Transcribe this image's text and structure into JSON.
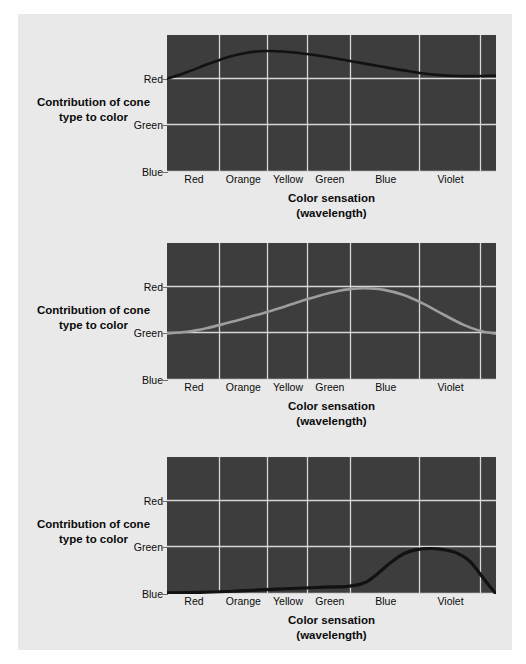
{
  "figure": {
    "background_color": "#e9e9e9",
    "page_color": "#ffffff"
  },
  "axis": {
    "y_title_line1": "Contribution of",
    "y_title_line2": "cone type to color",
    "x_title_line1": "Color sensation",
    "x_title_line2": "(wavelength)",
    "y_ticks": [
      "Red",
      "Green",
      "Blue"
    ],
    "x_ticks": [
      "Red",
      "Orange",
      "Yellow",
      "Green",
      "Blue",
      "Violet"
    ]
  },
  "chart_data": [
    {
      "type": "line",
      "title": "Red cone (long-wavelength) response",
      "xlabel": "Color sensation (wavelength)",
      "ylabel": "Contribution of cone type to color",
      "grid": true,
      "legend": "none",
      "plot_background": "#3d3d3d",
      "grid_color": "#d8d8d8",
      "line_color": "#121212",
      "line_width": 2.6,
      "y_tick_labels": [
        "Red",
        "Green",
        "Blue"
      ],
      "y_tick_positions": [
        0.32,
        0.66,
        1.0
      ],
      "x_tick_labels": [
        "Red",
        "Orange",
        "Yellow",
        "Green",
        "Blue",
        "Violet"
      ],
      "x_gridline_positions": [
        0.161,
        0.307,
        0.429,
        0.56,
        0.77,
        0.955
      ],
      "x_tick_label_positions": [
        0.082,
        0.232,
        0.368,
        0.495,
        0.665,
        0.862
      ],
      "x": [
        0.0,
        0.06,
        0.12,
        0.16,
        0.2,
        0.25,
        0.3,
        0.35,
        0.43,
        0.5,
        0.58,
        0.66,
        0.74,
        0.8,
        0.86,
        0.92,
        1.0
      ],
      "y": [
        0.32,
        0.272,
        0.216,
        0.182,
        0.152,
        0.127,
        0.117,
        0.12,
        0.14,
        0.166,
        0.2,
        0.234,
        0.266,
        0.286,
        0.297,
        0.3,
        0.297
      ],
      "note": "y in normalized plot fraction, 0 = top of plot, 1 = bottom of plot"
    },
    {
      "type": "line",
      "title": "Green cone (medium-wavelength) response",
      "xlabel": "Color sensation (wavelength)",
      "ylabel": "Contribution of cone type to color",
      "grid": true,
      "legend": "none",
      "plot_background": "#3d3d3d",
      "grid_color": "#d8d8d8",
      "line_color": "#9d9d9d",
      "line_width": 2.6,
      "y_tick_labels": [
        "Red",
        "Green",
        "Blue"
      ],
      "y_tick_positions": [
        0.32,
        0.66,
        1.0
      ],
      "x_tick_labels": [
        "Red",
        "Orange",
        "Yellow",
        "Green",
        "Blue",
        "Violet"
      ],
      "x_gridline_positions": [
        0.161,
        0.307,
        0.429,
        0.56,
        0.77,
        0.955
      ],
      "x_tick_label_positions": [
        0.082,
        0.232,
        0.368,
        0.495,
        0.665,
        0.862
      ],
      "x": [
        0.0,
        0.06,
        0.12,
        0.18,
        0.25,
        0.32,
        0.4,
        0.46,
        0.52,
        0.56,
        0.6,
        0.66,
        0.72,
        0.78,
        0.84,
        0.9,
        0.95,
        1.0
      ],
      "y": [
        0.66,
        0.648,
        0.622,
        0.586,
        0.54,
        0.492,
        0.43,
        0.386,
        0.35,
        0.336,
        0.33,
        0.342,
        0.38,
        0.444,
        0.522,
        0.596,
        0.64,
        0.662
      ],
      "note": "y in normalized plot fraction, 0 = top of plot, 1 = bottom of plot"
    },
    {
      "type": "line",
      "title": "Blue cone (short-wavelength) response",
      "xlabel": "Color sensation (wavelength)",
      "ylabel": "Contribution of cone type to color",
      "grid": true,
      "legend": "none",
      "plot_background": "#3d3d3d",
      "grid_color": "#d8d8d8",
      "line_color": "#121212",
      "line_width": 3.2,
      "y_tick_labels": [
        "Red",
        "Green",
        "Blue"
      ],
      "y_tick_positions": [
        0.32,
        0.66,
        1.0
      ],
      "x_tick_labels": [
        "Red",
        "Orange",
        "Yellow",
        "Green",
        "Blue",
        "Violet"
      ],
      "x_gridline_positions": [
        0.161,
        0.307,
        0.429,
        0.56,
        0.77,
        0.955
      ],
      "x_tick_label_positions": [
        0.082,
        0.232,
        0.368,
        0.495,
        0.665,
        0.862
      ],
      "x": [
        0.0,
        0.1,
        0.2,
        0.3,
        0.4,
        0.48,
        0.55,
        0.6,
        0.64,
        0.68,
        0.72,
        0.76,
        0.8,
        0.84,
        0.88,
        0.92,
        0.96,
        1.0
      ],
      "y": [
        0.992,
        0.988,
        0.98,
        0.968,
        0.958,
        0.95,
        0.944,
        0.918,
        0.852,
        0.77,
        0.706,
        0.676,
        0.668,
        0.676,
        0.7,
        0.76,
        0.88,
        1.0
      ],
      "note": "y in normalized plot fraction, 0 = top of plot, 1 = bottom of plot"
    }
  ]
}
